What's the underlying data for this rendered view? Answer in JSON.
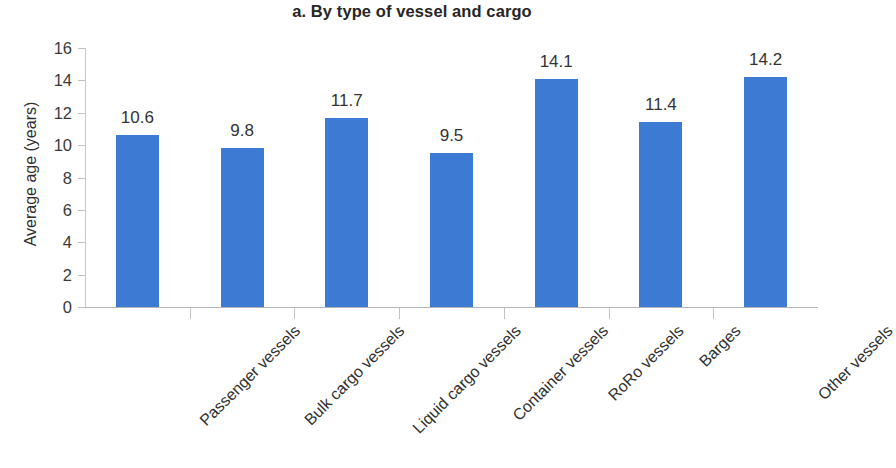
{
  "chart_data": {
    "type": "bar",
    "title": "a. By type of vessel and cargo",
    "xlabel": "",
    "ylabel": "Average age (years)",
    "categories": [
      "Passenger vessels",
      "Bulk cargo vessels",
      "Liquid cargo vessels",
      "Container vessels",
      "RoRo vessels",
      "Barges",
      "Other vessels"
    ],
    "values": [
      10.6,
      9.8,
      11.7,
      9.5,
      14.1,
      11.4,
      14.2
    ],
    "value_labels": [
      "10.6",
      "9.8",
      "11.7",
      "9.5",
      "14.1",
      "11.4",
      "14.2"
    ],
    "ylim": [
      0,
      16
    ],
    "ytick_values": [
      0,
      2,
      4,
      6,
      8,
      10,
      12,
      14,
      16
    ],
    "ytick_labels": [
      "0",
      "2",
      "4",
      "6",
      "8",
      "10",
      "12",
      "14",
      "16"
    ],
    "grid": false,
    "legend": null,
    "series_color": "#3d7ad4",
    "axis_color": "#c2c2c2",
    "text_color": "#333333"
  }
}
